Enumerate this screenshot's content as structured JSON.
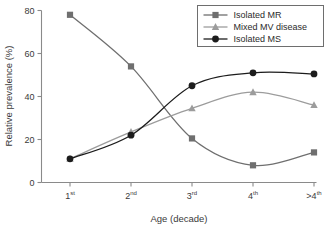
{
  "chart_data": {
    "type": "line",
    "title": "",
    "xlabel": "Age (decade)",
    "ylabel": "Relative prevalence (%)",
    "categories": [
      "1st",
      "2nd",
      "3rd",
      "4th",
      ">4th"
    ],
    "category_bases": [
      "1",
      "2",
      "3",
      "4",
      ">4"
    ],
    "category_sups": [
      "st",
      "nd",
      "rd",
      "th",
      "th"
    ],
    "ylim": [
      0,
      80
    ],
    "yticks": [
      0,
      20,
      40,
      60,
      80
    ],
    "grid": false,
    "legend_position": "top-right",
    "series": [
      {
        "name": "Isolated MR",
        "marker": "square",
        "color": "#6f6f6f",
        "values": [
          78,
          54,
          20.5,
          8,
          14
        ]
      },
      {
        "name": "Mixed MV disease",
        "marker": "triangle",
        "color": "#9c9c9c",
        "values": [
          11,
          23.5,
          34.5,
          42,
          36
        ]
      },
      {
        "name": "Isolated MS",
        "marker": "circle",
        "color": "#1c1c1c",
        "values": [
          11,
          22,
          45,
          51,
          50.5
        ]
      }
    ]
  },
  "axis": {
    "y_tick_labels": [
      "0",
      "20",
      "40",
      "60",
      "80"
    ],
    "y_axis_title": "Relative prevalence (%)",
    "x_axis_title": "Age (decade)"
  },
  "legend": {
    "items": [
      {
        "label": "Isolated MR"
      },
      {
        "label": "Mixed MV disease"
      },
      {
        "label": "Isolated MS"
      }
    ]
  }
}
